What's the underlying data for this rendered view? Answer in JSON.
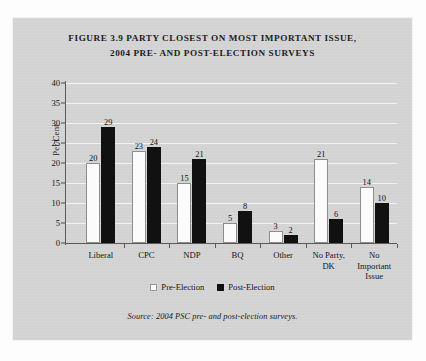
{
  "figure": {
    "title_line1": "FIGURE 3.9 PARTY CLOSEST ON MOST IMPORTANT ISSUE,",
    "title_line2": "2004 PRE- AND POST-ELECTION SURVEYS",
    "source_note": "Source: 2004 PSC pre- and post-election surveys."
  },
  "chart_data": {
    "type": "bar",
    "title": "FIGURE 3.9 PARTY CLOSEST ON MOST IMPORTANT ISSUE, 2004 PRE- AND POST-ELECTION SURVEYS",
    "xlabel": "",
    "ylabel": "Per Cent",
    "ylim": [
      0,
      40
    ],
    "yticks": [
      0,
      5,
      10,
      15,
      20,
      25,
      30,
      35,
      40
    ],
    "ytick_labels": [
      "0",
      "5",
      "10",
      "15",
      "20",
      "25",
      "30",
      "35",
      "40"
    ],
    "grid": true,
    "legend_position": "bottom-center",
    "categories": [
      "Liberal",
      "CPC",
      "NDP",
      "BQ",
      "Other",
      "No Party,\nDK",
      "No\nImportant\nIssue"
    ],
    "series": [
      {
        "name": "Pre-Election",
        "color": "#fbfbfb",
        "values": [
          20,
          23,
          15,
          5,
          3,
          21,
          14
        ]
      },
      {
        "name": "Post-Election",
        "color": "#111111",
        "values": [
          29,
          24,
          21,
          8,
          2,
          6,
          10
        ]
      }
    ],
    "annotations": "Source: 2004 PSC pre- and post-election surveys."
  },
  "legend": {
    "items": [
      {
        "label": "Pre-Election",
        "swatch": "white-square"
      },
      {
        "label": "Post-Election",
        "swatch": "black-square"
      }
    ]
  }
}
